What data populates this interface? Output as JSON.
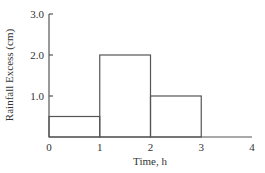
{
  "chart_data": {
    "type": "bar",
    "title": "",
    "xlabel": "Time, h",
    "ylabel": "Rainfall Excess (cm)",
    "x_ticks": [
      "0",
      "1",
      "2",
      "3",
      "4"
    ],
    "y_ticks": [
      "1.0",
      "2.0",
      "3.0"
    ],
    "xlim": [
      0,
      4
    ],
    "ylim": [
      0,
      3.0
    ],
    "grid": false,
    "legend": null,
    "bins": [
      {
        "start": 0,
        "end": 1,
        "value": 0.5
      },
      {
        "start": 1,
        "end": 2,
        "value": 2.0
      },
      {
        "start": 2,
        "end": 3,
        "value": 1.0
      }
    ],
    "categories": [
      "0-1",
      "1-2",
      "2-3"
    ],
    "values": [
      0.5,
      2.0,
      1.0
    ]
  },
  "colors": {
    "line": "#555555",
    "text": "#333333"
  }
}
